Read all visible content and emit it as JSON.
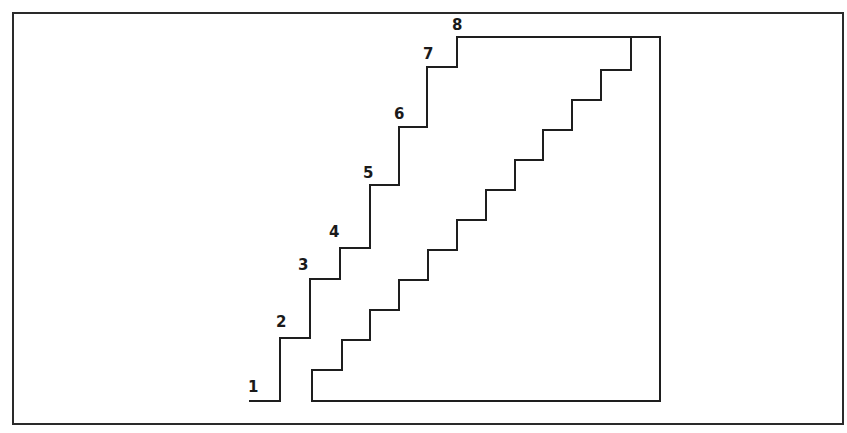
{
  "diagram": {
    "type": "staircase-cross-section",
    "colors": {
      "line": "#1e1e1e",
      "frame": "#2a2a2a",
      "background": "#ffffff",
      "label": "#1a1a1a"
    },
    "frame": {
      "x": 13,
      "y": 13,
      "width": 830,
      "height": 411
    },
    "step_labels": [
      {
        "text": "1",
        "x": 250,
        "y": 392
      },
      {
        "text": "2",
        "x": 281,
        "y": 327
      },
      {
        "text": "3",
        "x": 303,
        "y": 270
      },
      {
        "text": "4",
        "x": 334,
        "y": 237
      },
      {
        "text": "5",
        "x": 368,
        "y": 178
      },
      {
        "text": "6",
        "x": 399,
        "y": 119
      },
      {
        "text": "7",
        "x": 428,
        "y": 59
      },
      {
        "text": "8",
        "x": 457,
        "y": 30
      }
    ],
    "upper_stair_points": "250,401 280,401 280,338 310,338 310,279 340,279 340,248 370,248 370,185 399,185 399,127 427,127 427,67 457,67 457,37 660,37 660,401 312,401",
    "lower_stair_points": "312,401 312,370 342,370 342,340 370,340 370,310 399,310 399,280 428,280 428,250 457,250 457,220 486,220 486,190 515,190 515,160 543,160 543,130 572,130 572,100 601,100 601,70 631,70 631,37"
  }
}
